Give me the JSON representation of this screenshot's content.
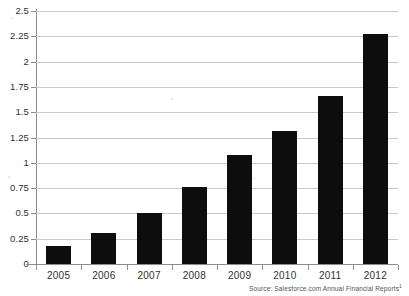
{
  "chart_data": {
    "type": "bar",
    "title": "",
    "subtitle": "",
    "xlabel": "",
    "ylabel": "",
    "categories": [
      "2005",
      "2006",
      "2007",
      "2008",
      "2009",
      "2010",
      "2011",
      "2012"
    ],
    "values": [
      0.18,
      0.31,
      0.5,
      0.76,
      1.08,
      1.31,
      1.66,
      2.27
    ],
    "series": [
      {
        "name": "Annual Revenue",
        "values": [
          0.18,
          0.31,
          0.5,
          0.76,
          1.08,
          1.31,
          1.66,
          2.27
        ]
      }
    ],
    "ylim": [
      0,
      2.5
    ],
    "ytick_labels": [
      "2.5",
      "2.25",
      "2",
      "1.75",
      "1.5",
      "1.25",
      "1",
      "0.75",
      "0.5",
      "0.25",
      "0"
    ],
    "ytick_values": [
      2.5,
      2.25,
      2,
      1.75,
      1.5,
      1.25,
      1,
      0.75,
      0.5,
      0.25,
      0
    ],
    "grid": true,
    "legend": false,
    "legend_position": "none",
    "bar_color": "#0d0d0d",
    "gridline_color": "#c9c9c9",
    "axis_color": "#8d8d8d",
    "background_color": "#ffffff"
  },
  "annotations": {
    "source_text": "Source: Salesforce.com Annual Financial Reports",
    "source_footnote_marker": "1"
  }
}
